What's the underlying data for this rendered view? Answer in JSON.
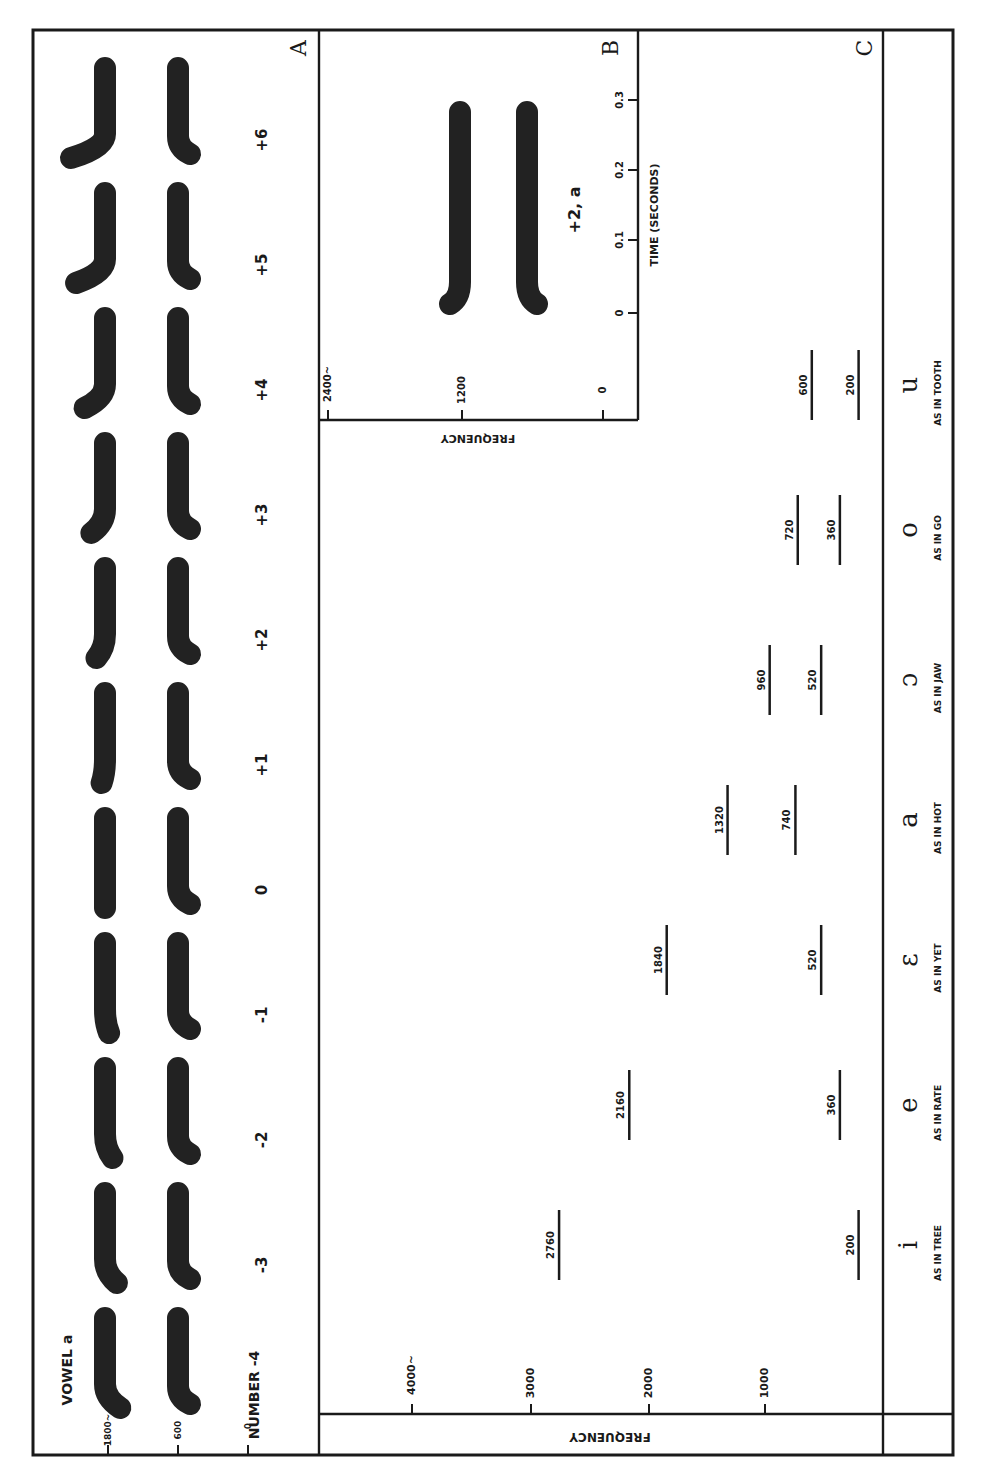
{
  "figure": {
    "orientation": "rotated 90 degrees clockwise (axes labels read sideways)",
    "panels": [
      "A",
      "B",
      "C"
    ]
  },
  "panel_a": {
    "label": "A",
    "title": "VOWEL a",
    "number_axis_label": "NUMBER",
    "freq_ticks": [
      {
        "label": "1800~",
        "value": 1800
      },
      {
        "label": "600",
        "value": 600
      },
      {
        "label": "0",
        "value": 0
      }
    ],
    "patterns": [
      {
        "number": "-4",
        "f2_bend": 0.45
      },
      {
        "number": "-3",
        "f2_bend": 0.35
      },
      {
        "number": "-2",
        "f2_bend": 0.22
      },
      {
        "number": "-1",
        "f2_bend": 0.12
      },
      {
        "number": "0",
        "f2_bend": 0.0
      },
      {
        "number": "+1",
        "f2_bend": -0.1
      },
      {
        "number": "+2",
        "f2_bend": -0.25
      },
      {
        "number": "+3",
        "f2_bend": -0.4
      },
      {
        "number": "+4",
        "f2_bend": -0.6
      },
      {
        "number": "+5",
        "f2_bend": -0.85
      },
      {
        "number": "+6",
        "f2_bend": -1.0
      }
    ]
  },
  "panel_b": {
    "label": "B",
    "pattern_label": "+2, a",
    "freq_axis_label": "FREQUENCY",
    "freq_ticks": [
      "2400~",
      "1200",
      "0"
    ],
    "time_axis_label": "TIME (SECONDS)",
    "time_ticks": [
      "0",
      "0.1",
      "0.2",
      "0.3"
    ]
  },
  "panel_c": {
    "label": "C",
    "freq_axis_label": "FREQUENCY",
    "freq_ticks": [
      "4000~",
      "3000",
      "2000",
      "1000"
    ]
  },
  "chart_data": [
    {
      "type": "table",
      "title": "Panel C: Two-formant patterns for seven vowels",
      "xlabel": "FREQUENCY",
      "ylabel": "",
      "axis_range": [
        0,
        4000
      ],
      "axis_ticks": [
        1000,
        2000,
        3000,
        4000
      ],
      "categories": [
        "i",
        "e",
        "ε",
        "a",
        "ɔ",
        "o",
        "u"
      ],
      "examples": [
        "AS IN TREE",
        "AS IN RATE",
        "AS IN YET",
        "AS IN HOT",
        "AS IN JAW",
        "AS IN GO",
        "AS IN TOOTH"
      ],
      "series": [
        {
          "name": "Second formant (Hz)",
          "values": [
            2760,
            2160,
            1840,
            1320,
            960,
            720,
            600
          ]
        },
        {
          "name": "First formant (Hz)",
          "values": [
            200,
            360,
            520,
            740,
            520,
            360,
            200
          ]
        }
      ]
    },
    {
      "type": "line",
      "title": "Panel A: Vowel a with second-formant transitions numbered -4 to +6",
      "xlabel": "NUMBER",
      "ylabel": "FREQUENCY",
      "categories": [
        "-4",
        "-3",
        "-2",
        "-1",
        "0",
        "+1",
        "+2",
        "+3",
        "+4",
        "+5",
        "+6"
      ],
      "y_ticks": [
        0,
        600,
        1800
      ],
      "series": [
        {
          "name": "Formant 1 steady state (approx Hz)",
          "values": [
            740,
            740,
            740,
            740,
            740,
            740,
            740,
            740,
            740,
            740,
            740
          ]
        },
        {
          "name": "Formant 2 steady state (approx Hz)",
          "values": [
            1320,
            1320,
            1320,
            1320,
            1320,
            1320,
            1320,
            1320,
            1320,
            1320,
            1320
          ]
        }
      ]
    },
    {
      "type": "line",
      "title": "Panel B: Pattern +2, a",
      "xlabel": "TIME (SECONDS)",
      "ylabel": "FREQUENCY",
      "x_ticks": [
        0,
        0.1,
        0.2,
        0.3
      ],
      "y_ticks": [
        0,
        1200,
        2400
      ],
      "xlim": [
        0,
        0.3
      ],
      "ylim": [
        0,
        2400
      ],
      "series": [
        {
          "name": "Formant 2",
          "x": [
            0,
            0.05,
            0.3
          ],
          "values": [
            1440,
            1320,
            1320
          ]
        },
        {
          "name": "Formant 1",
          "x": [
            0,
            0.05,
            0.3
          ],
          "values": [
            560,
            740,
            740
          ]
        }
      ]
    }
  ],
  "colors": {
    "ink": "#1a1a1a",
    "paper": "#ffffff"
  }
}
